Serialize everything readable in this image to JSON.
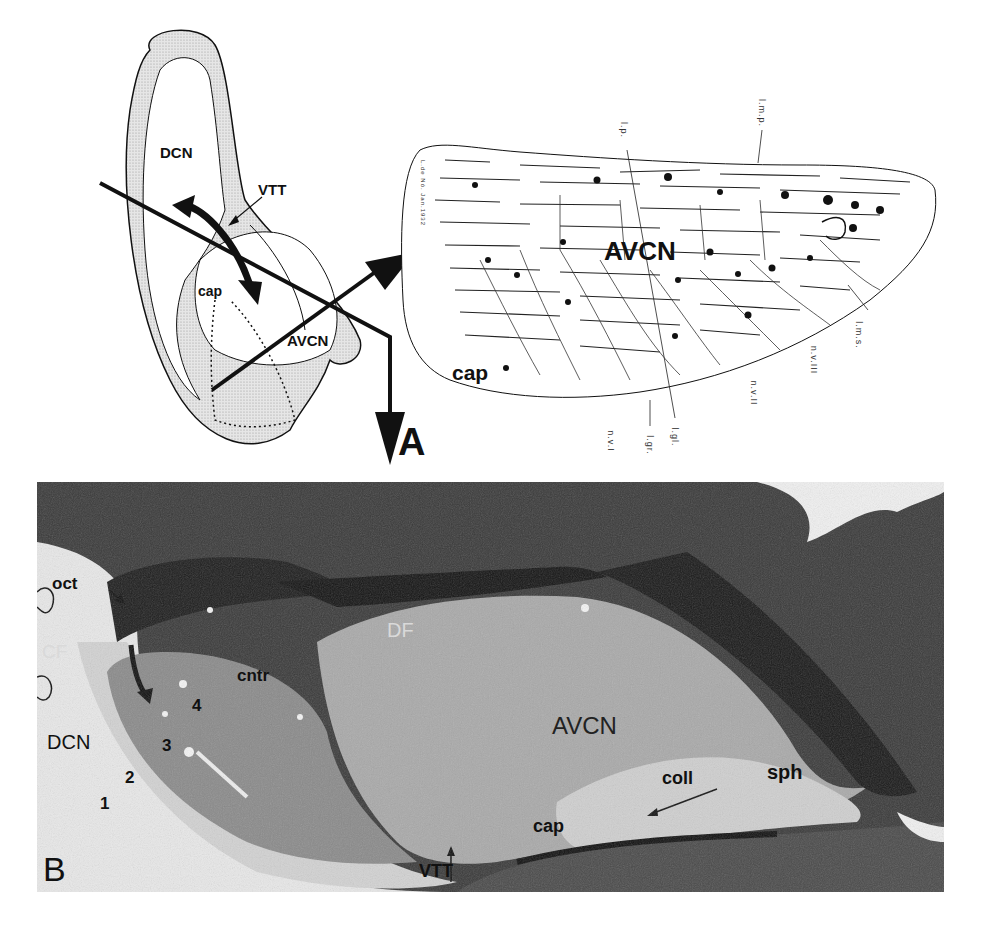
{
  "figure": {
    "panel_a": {
      "letter": "A",
      "schematic": {
        "labels": {
          "dcn": "DCN",
          "vtt": "VTT",
          "cap": "cap",
          "avcn": "AVCN"
        }
      },
      "drawing": {
        "labels": {
          "avcn": "AVCN",
          "cap": "cap",
          "lp": "l.p.",
          "lmp": "l.m.p.",
          "lms": "l.m.s.",
          "nviii": "n.v.III",
          "nvii": "n.v.II",
          "nvi": "n.v.I",
          "lgl": "l.gl.",
          "lgr": "l.gr.",
          "signature": "L.de Nó. Jan.1932"
        }
      }
    },
    "panel_b": {
      "letter": "B",
      "labels": {
        "oct": "oct",
        "cf": "CF",
        "dcn": "DCN",
        "layer1": "1",
        "layer2": "2",
        "layer3": "3",
        "layer4": "4",
        "cntr": "cntr",
        "df": "DF",
        "avcn": "AVCN",
        "coll": "coll",
        "sph": "sph",
        "cap": "cap",
        "vtt": "VTT"
      }
    }
  }
}
